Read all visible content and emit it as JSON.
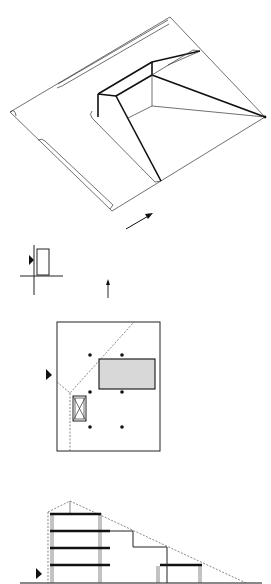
{
  "diagram": {
    "background": "#ffffff",
    "ink": "#111111",
    "fill_gray": "#d8d8d8",
    "axonometric": {
      "outer_outline": [
        [
          10,
          112
        ],
        [
          170,
          17
        ],
        [
          265,
          117
        ],
        [
          112,
          211
        ]
      ],
      "left_groove": [
        [
          40,
          137
        ],
        [
          112,
          208
        ]
      ],
      "top_groove": [
        [
          60,
          84
        ],
        [
          168,
          20
        ]
      ],
      "inner_pit": {
        "wall_top_front": [
          [
            98,
            94
          ],
          [
            116,
            96
          ]
        ],
        "left_wall": [
          [
            98,
            94
          ],
          [
            98,
            116
          ]
        ],
        "rim": [
          [
            98,
            94
          ],
          [
            152,
            62
          ],
          [
            200,
            51
          ]
        ],
        "rim_inner": [
          [
            116,
            96
          ],
          [
            152,
            75
          ]
        ],
        "ridge_to_apex": [
          [
            152,
            75
          ],
          [
            265,
            117
          ]
        ],
        "front_edge": [
          [
            116,
            96
          ],
          [
            161,
            181
          ]
        ],
        "floor_edges": [
          [
            [
              152,
              75
            ],
            [
              152,
              106
            ]
          ],
          [
            [
              152,
              106
            ],
            [
              265,
              117
            ]
          ],
          [
            [
              152,
              106
            ],
            [
              130,
              118
            ]
          ]
        ]
      },
      "apex": [
        265,
        117
      ],
      "arrow": {
        "from": [
          126,
          229
        ],
        "to": [
          152,
          214
        ]
      }
    },
    "key_plan": {
      "cross_h": [
        [
          20,
          276
        ],
        [
          63,
          276
        ]
      ],
      "cross_v": [
        [
          34,
          245
        ],
        [
          34,
          295
        ]
      ],
      "building_rect": {
        "x": 37,
        "y": 249,
        "w": 12,
        "h": 26
      },
      "entry_marker": [
        30,
        260
      ],
      "north_arrow": {
        "from": [
          108,
          298
        ],
        "to": [
          108,
          280
        ]
      }
    },
    "plan": {
      "frame": {
        "x": 57,
        "y": 322,
        "w": 103,
        "h": 129
      },
      "gray_block": {
        "x": 99,
        "y": 359,
        "w": 56,
        "h": 30
      },
      "lift_box": {
        "x": 73,
        "y": 395,
        "w": 13,
        "h": 25
      },
      "columns": [
        [
          90,
          355
        ],
        [
          122,
          355
        ],
        [
          90,
          392
        ],
        [
          122,
          392
        ],
        [
          90,
          427
        ],
        [
          122,
          427
        ]
      ],
      "dashed": [
        [
          [
            57,
            382
          ],
          [
            70,
            395
          ],
          [
            133,
            322
          ]
        ],
        [
          [
            70,
            395
          ],
          [
            70,
            451
          ]
        ]
      ],
      "entry_marker": [
        49,
        375
      ]
    },
    "section": {
      "ground": [
        [
          20,
          583
        ],
        [
          262,
          583
        ]
      ],
      "slabs": [
        [
          [
            50,
            514
          ],
          [
            101,
            514
          ]
        ],
        [
          [
            50,
            531
          ],
          [
            110,
            531
          ]
        ],
        [
          [
            50,
            548
          ],
          [
            110,
            548
          ]
        ],
        [
          [
            50,
            565
          ],
          [
            110,
            565
          ]
        ],
        [
          [
            160,
            565
          ],
          [
            201,
            565
          ]
        ]
      ],
      "profile": [
        [
          110,
          531
        ],
        [
          133,
          531
        ],
        [
          133,
          547
        ],
        [
          167,
          547
        ],
        [
          167,
          583
        ]
      ],
      "roof_dashed": [
        [
          47,
          511
        ],
        [
          70,
          501
        ],
        [
          245,
          583
        ]
      ],
      "left_dashed": [
        [
          47,
          511
        ],
        [
          47,
          583
        ]
      ],
      "columns": [
        [
          52,
          513,
          52,
          583
        ],
        [
          100,
          513,
          100,
          583
        ],
        [
          158,
          565,
          158,
          583
        ],
        [
          200,
          565,
          200,
          583
        ],
        [
          70,
          501,
          70,
          513
        ]
      ],
      "entry_marker": [
        39,
        573
      ]
    }
  }
}
